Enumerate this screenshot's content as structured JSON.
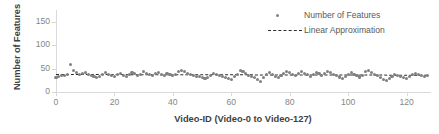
{
  "chart_data": {
    "type": "scatter",
    "title": "",
    "xlabel": "Video-ID (Video-0 to Video-127)",
    "ylabel": "Number of Features",
    "xlim": [
      0,
      128
    ],
    "ylim": [
      0,
      175
    ],
    "yticks": [
      0,
      50,
      100,
      150
    ],
    "xticks": [
      0,
      20,
      40,
      60,
      80,
      100,
      120
    ],
    "grid": false,
    "legend_position": "top-right",
    "marker_color": "#808080",
    "trend_color": "#2b2b2b",
    "series": [
      {
        "name": "Number of Features",
        "marker": "circle",
        "x": [
          0,
          1,
          2,
          3,
          4,
          5,
          6,
          7,
          8,
          9,
          10,
          11,
          12,
          13,
          14,
          15,
          16,
          17,
          18,
          19,
          20,
          21,
          22,
          23,
          24,
          25,
          26,
          27,
          28,
          29,
          30,
          31,
          32,
          33,
          34,
          35,
          36,
          37,
          38,
          39,
          40,
          41,
          42,
          43,
          44,
          45,
          46,
          47,
          48,
          49,
          50,
          51,
          52,
          53,
          54,
          55,
          56,
          57,
          58,
          59,
          60,
          61,
          62,
          63,
          64,
          65,
          66,
          67,
          68,
          69,
          70,
          71,
          72,
          73,
          74,
          75,
          76,
          77,
          78,
          79,
          80,
          81,
          82,
          83,
          84,
          85,
          86,
          87,
          88,
          89,
          90,
          91,
          92,
          93,
          94,
          95,
          96,
          97,
          98,
          99,
          100,
          101,
          102,
          103,
          104,
          105,
          106,
          107,
          108,
          109,
          110,
          111,
          112,
          113,
          114,
          115,
          116,
          117,
          118,
          119,
          120,
          121,
          122,
          123,
          124,
          125,
          126,
          127
        ],
        "values": [
          30,
          33,
          36,
          35,
          37,
          58,
          46,
          41,
          38,
          40,
          42,
          38,
          35,
          33,
          31,
          34,
          38,
          41,
          37,
          35,
          34,
          38,
          40,
          36,
          34,
          37,
          41,
          39,
          36,
          38,
          43,
          40,
          37,
          35,
          39,
          42,
          38,
          36,
          40,
          37,
          35,
          38,
          43,
          46,
          44,
          40,
          38,
          36,
          34,
          33,
          30,
          28,
          31,
          36,
          40,
          38,
          35,
          33,
          31,
          29,
          27,
          33,
          38,
          45,
          43,
          39,
          36,
          33,
          30,
          27,
          23,
          31,
          38,
          41,
          37,
          34,
          31,
          36,
          40,
          44,
          41,
          38,
          35,
          39,
          43,
          40,
          37,
          34,
          38,
          42,
          39,
          36,
          40,
          44,
          42,
          38,
          35,
          32,
          29,
          33,
          37,
          41,
          38,
          35,
          32,
          36,
          43,
          46,
          42,
          38,
          35,
          31,
          27,
          24,
          28,
          33,
          38,
          36,
          34,
          31,
          29,
          33,
          37,
          40,
          38,
          35,
          33,
          36
        ]
      }
    ],
    "trendline": {
      "name": "Linear Approximation",
      "style": "dashed",
      "y_start": 37.5,
      "y_end": 36.0
    },
    "legend": [
      {
        "label": "Number of Features",
        "type": "marker"
      },
      {
        "label": "Linear Approximation",
        "type": "dashed-line"
      }
    ]
  }
}
